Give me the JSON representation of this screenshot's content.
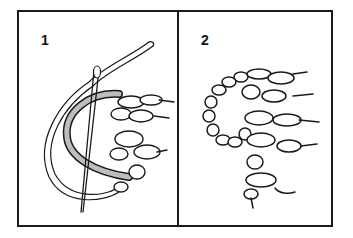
{
  "figure": {
    "type": "instructional-illustration",
    "panels": [
      {
        "number": "1",
        "content": "needle and yarn threaded through a row of stitches, looping around"
      },
      {
        "number": "2",
        "content": "finished result: curled chain of stitches joined to knitted fabric"
      }
    ]
  },
  "colors": {
    "line": "#1a1a1a",
    "background": "#ffffff",
    "yarn_fill": "#bdbdbd"
  }
}
